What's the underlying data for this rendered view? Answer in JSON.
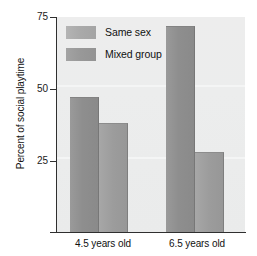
{
  "chart_data": {
    "type": "bar",
    "title": "",
    "xlabel": "",
    "ylabel": "Percent of social playtime",
    "categories": [
      "4.5 years old",
      "6.5 years old"
    ],
    "series": [
      {
        "name": "Same sex",
        "values": [
          47,
          72
        ],
        "color": "#8e8e8e"
      },
      {
        "name": "Mixed group",
        "values": [
          38,
          28
        ],
        "color": "#9c9c9c"
      }
    ],
    "ylim": [
      0,
      75
    ],
    "yticks": [
      25,
      50,
      75
    ],
    "ytick_labels": [
      "25",
      "50",
      "75"
    ],
    "grid": false,
    "legend_position": "top-left",
    "plot_background": "#ececec"
  },
  "axis": {
    "y_title": "Percent of social playtime",
    "y_ticks": [
      {
        "label": "75",
        "value": 75
      },
      {
        "label": "50",
        "value": 50
      },
      {
        "label": "25",
        "value": 25
      }
    ],
    "x_ticks": [
      {
        "label": "4.5 years old"
      },
      {
        "label": "6.5 years old"
      }
    ]
  },
  "legend": {
    "items": [
      {
        "label": "Same sex",
        "swatch": "same-sex"
      },
      {
        "label": "Mixed group",
        "swatch": "mixed-group"
      }
    ]
  },
  "bars": [
    {
      "series": "Same sex",
      "group": "4.5 years old",
      "value": 47,
      "class": "same-sex",
      "left": 13,
      "width": 29
    },
    {
      "series": "Mixed group",
      "group": "4.5 years old",
      "value": 38,
      "class": "mixed-group",
      "left": 42,
      "width": 29
    },
    {
      "series": "Same sex",
      "group": "6.5 years old",
      "value": 72,
      "class": "same-sex",
      "left": 109,
      "width": 29
    },
    {
      "series": "Mixed group",
      "group": "6.5 years old",
      "value": 28,
      "class": "mixed-group",
      "left": 138,
      "width": 29
    }
  ]
}
